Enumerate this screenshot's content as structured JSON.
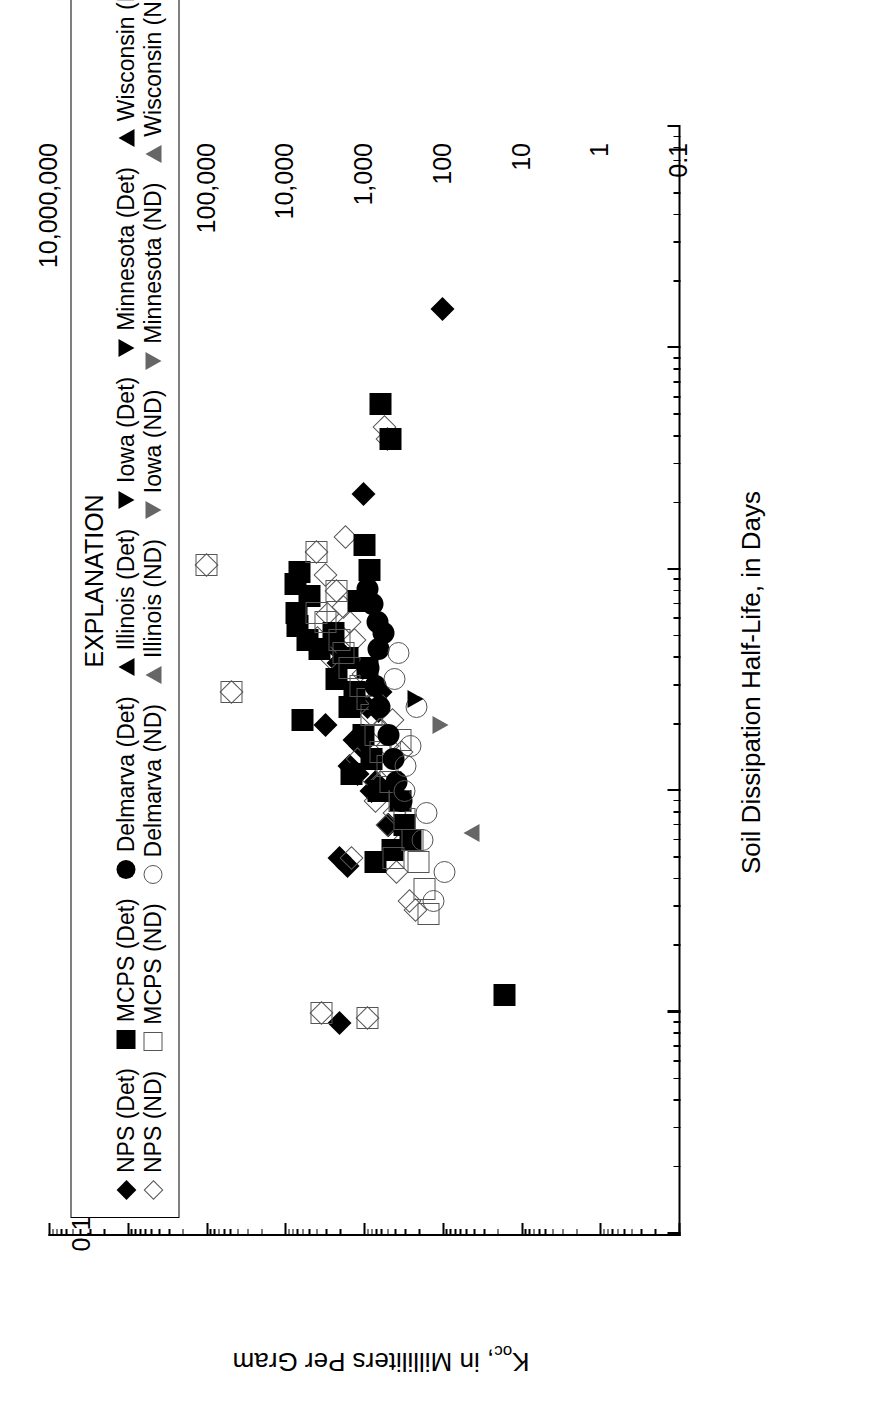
{
  "chart_data": {
    "type": "scatter",
    "title": "",
    "xlabel": "Soil Dissipation Half-Life, in Days",
    "ylabel": "Koc, in Milliliters Per Gram",
    "ylabel_base": "K",
    "ylabel_sub": "oc",
    "ylabel_rest": ", in Milliliters Per Gram",
    "xscale": "log",
    "yscale": "log",
    "xlim": [
      0.1,
      10000
    ],
    "ylim": [
      0.1,
      10000000
    ],
    "xticks": [
      "0.1",
      "1",
      "10",
      "100",
      "1,000",
      "10,000"
    ],
    "xtick_values": [
      0.1,
      1,
      10,
      100,
      1000,
      10000
    ],
    "yticks": [
      "0.1",
      "1",
      "10",
      "100",
      "1,000",
      "10,000",
      "100,000",
      "1,000,000",
      "10,000,000"
    ],
    "ytick_values": [
      0.1,
      1,
      10,
      100,
      1000,
      10000,
      100000,
      1000000,
      10000000
    ],
    "grid": false,
    "legend_position": "top-left",
    "legend_title": "EXPLANATION",
    "series": [
      {
        "name": "NPS (Det)",
        "marker": "diamond",
        "fill": "filled",
        "points": [
          [
            1500,
            100
          ],
          [
            220,
            1000
          ],
          [
            24,
            900
          ],
          [
            0.9,
            2000
          ],
          [
            20,
            3000
          ],
          [
            13,
            1500
          ],
          [
            12,
            1200
          ],
          [
            17,
            1300
          ],
          [
            10,
            800
          ],
          [
            5,
            2000
          ],
          [
            11,
            700
          ],
          [
            23,
            650
          ],
          [
            28,
            600
          ],
          [
            16,
            1100
          ],
          [
            7,
            480
          ],
          [
            4.6,
            1600
          ],
          [
            45,
            2300
          ],
          [
            38,
            2100
          ]
        ]
      },
      {
        "name": "NPS (ND)",
        "marker": "diamond",
        "fill": "open",
        "points": [
          [
            105,
            100000
          ],
          [
            28,
            48000
          ],
          [
            440,
            540
          ],
          [
            390,
            500
          ],
          [
            120,
            4000
          ],
          [
            95,
            3000
          ],
          [
            80,
            2200
          ],
          [
            68,
            1800
          ],
          [
            58,
            1500
          ],
          [
            48,
            1300
          ],
          [
            40,
            2600
          ],
          [
            34,
            1000
          ],
          [
            30,
            900
          ],
          [
            26,
            700
          ],
          [
            22,
            800
          ],
          [
            19,
            600
          ],
          [
            16,
            500
          ],
          [
            14,
            1200
          ],
          [
            12,
            900
          ],
          [
            11,
            600
          ],
          [
            9,
            700
          ],
          [
            8,
            400
          ],
          [
            7,
            500
          ],
          [
            6,
            300
          ],
          [
            5,
            1400
          ],
          [
            4.3,
            380
          ],
          [
            3.2,
            260
          ],
          [
            2.9,
            220
          ],
          [
            1,
            3400
          ],
          [
            0.95,
            900
          ],
          [
            49,
            3800
          ],
          [
            63,
            2900
          ],
          [
            140,
            1700
          ],
          [
            21,
            430
          ],
          [
            15,
            330
          ]
        ]
      },
      {
        "name": "MCPS (Det)",
        "marker": "square",
        "fill": "filled",
        "points": [
          [
            560,
            600
          ],
          [
            390,
            450
          ],
          [
            98,
            6500
          ],
          [
            86,
            7200
          ],
          [
            76,
            4800
          ],
          [
            64,
            7000
          ],
          [
            56,
            6800
          ],
          [
            52,
            2400
          ],
          [
            48,
            5200
          ],
          [
            44,
            3600
          ],
          [
            40,
            1600
          ],
          [
            36,
            900
          ],
          [
            32,
            2200
          ],
          [
            28,
            1300
          ],
          [
            24,
            1500
          ],
          [
            21,
            6000
          ],
          [
            18,
            1000
          ],
          [
            14,
            800
          ],
          [
            12,
            1400
          ],
          [
            10,
            640
          ],
          [
            9,
            340
          ],
          [
            7,
            300
          ],
          [
            6,
            250
          ],
          [
            5.4,
            430
          ],
          [
            4.8,
            700
          ],
          [
            1.2,
            16
          ],
          [
            100,
            830
          ],
          [
            130,
            980
          ],
          [
            72,
            1150
          ]
        ]
      },
      {
        "name": "MCPS (ND)",
        "marker": "square",
        "fill": "open",
        "points": [
          [
            105,
            100000
          ],
          [
            28,
            48000
          ],
          [
            58,
            3000
          ],
          [
            48,
            2000
          ],
          [
            42,
            1800
          ],
          [
            36,
            1500
          ],
          [
            30,
            1100
          ],
          [
            26,
            900
          ],
          [
            22,
            800
          ],
          [
            18,
            700
          ],
          [
            15,
            600
          ],
          [
            13,
            500
          ],
          [
            11,
            450
          ],
          [
            9,
            350
          ],
          [
            7.5,
            300
          ],
          [
            6,
            240
          ],
          [
            4.8,
            200
          ],
          [
            3.6,
            170
          ],
          [
            2.8,
            150
          ],
          [
            1,
            3400
          ],
          [
            0.95,
            900
          ],
          [
            64,
            3900
          ],
          [
            80,
            2200
          ],
          [
            120,
            4000
          ],
          [
            5,
            420
          ],
          [
            17,
            340
          ]
        ]
      },
      {
        "name": "Delmarva (Det)",
        "marker": "circle",
        "fill": "filled",
        "points": [
          [
            82,
            900
          ],
          [
            70,
            760
          ],
          [
            58,
            660
          ],
          [
            52,
            560
          ],
          [
            44,
            640
          ],
          [
            36,
            860
          ],
          [
            30,
            700
          ],
          [
            24,
            620
          ],
          [
            18,
            480
          ],
          [
            14,
            420
          ],
          [
            11,
            380
          ],
          [
            9,
            330
          ]
        ]
      },
      {
        "name": "Delmarva (ND)",
        "marker": "circle",
        "fill": "open",
        "points": [
          [
            6,
            180
          ],
          [
            4.3,
            95
          ],
          [
            3.2,
            130
          ],
          [
            10,
            300
          ],
          [
            16,
            250
          ],
          [
            24,
            210
          ],
          [
            32,
            400
          ],
          [
            42,
            360
          ],
          [
            13,
            290
          ],
          [
            8,
            160
          ]
        ]
      },
      {
        "name": "Illinois (Det)",
        "marker": "triangle-up",
        "fill": "filled",
        "points": []
      },
      {
        "name": "Illinois (ND)",
        "marker": "triangle-up",
        "fill": "open",
        "points": [
          [
            6.5,
            43
          ]
        ]
      },
      {
        "name": "Iowa (Det)",
        "marker": "triangle-down",
        "fill": "filled",
        "points": [
          [
            26,
            220
          ]
        ]
      },
      {
        "name": "Iowa (ND)",
        "marker": "triangle-down",
        "fill": "open",
        "points": [
          [
            20,
            105
          ]
        ]
      },
      {
        "name": "Minnesota (Det)",
        "marker": "triangle-down",
        "fill": "filled",
        "points": []
      },
      {
        "name": "Minnesota (ND)",
        "marker": "triangle-down",
        "fill": "open",
        "points": []
      },
      {
        "name": "Wisconsin (Det)",
        "marker": "triangle-up",
        "fill": "filled",
        "points": []
      },
      {
        "name": "Wisconsin (ND)",
        "marker": "triangle-up",
        "fill": "open",
        "points": []
      }
    ]
  },
  "legend": {
    "title": "EXPLANATION",
    "rows": [
      [
        {
          "label": "NPS (Det)",
          "marker": "diamond",
          "fill": "filled"
        },
        {
          "label": "MCPS (Det)",
          "marker": "square",
          "fill": "filled"
        },
        {
          "label": "Delmarva (Det)",
          "marker": "circle",
          "fill": "filled"
        },
        {
          "label": "Illinois (Det)",
          "marker": "triangle-up",
          "fill": "filled"
        },
        {
          "label": "Iowa (Det)",
          "marker": "triangle-down",
          "fill": "filled"
        },
        {
          "label": "Minnesota (Det)",
          "marker": "triangle-down",
          "fill": "filled"
        },
        {
          "label": "Wisconsin (Det)",
          "marker": "triangle-up",
          "fill": "filled"
        }
      ],
      [
        {
          "label": "NPS (ND)",
          "marker": "diamond",
          "fill": "open"
        },
        {
          "label": "MCPS (ND)",
          "marker": "square",
          "fill": "open"
        },
        {
          "label": "Delmarva (ND)",
          "marker": "circle",
          "fill": "open"
        },
        {
          "label": "Illinois (ND)",
          "marker": "triangle-up",
          "fill": "open"
        },
        {
          "label": "Iowa (ND)",
          "marker": "triangle-down",
          "fill": "open"
        },
        {
          "label": "Minnesota (ND)",
          "marker": "triangle-down",
          "fill": "open"
        },
        {
          "label": "Wisconsin (ND)",
          "marker": "triangle-up",
          "fill": "open"
        }
      ]
    ]
  },
  "colors": {
    "ink": "#000000",
    "open_stroke": "#555555",
    "background": "#ffffff"
  }
}
